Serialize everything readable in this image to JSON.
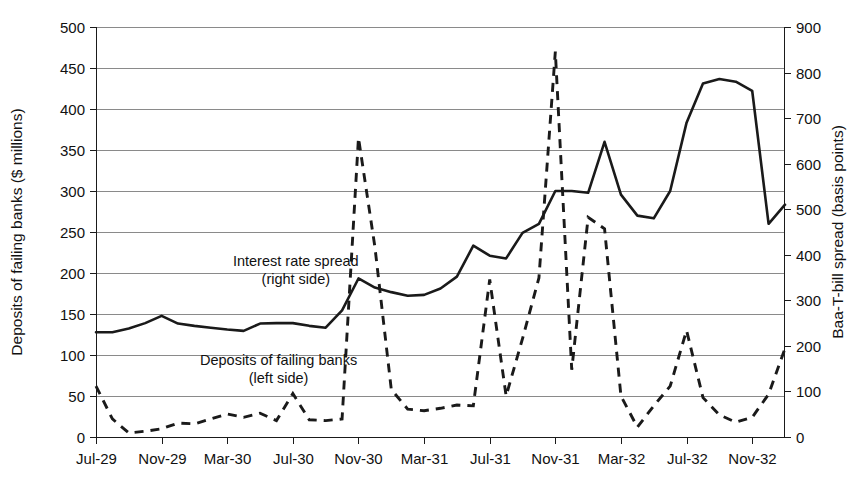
{
  "chart_data": {
    "type": "line",
    "title": "",
    "xlabel": "",
    "grid": true,
    "legend_position": "inline-annotations",
    "x_tick_labels": [
      "Jul-29",
      "Nov-29",
      "Mar-30",
      "Jul-30",
      "Nov-30",
      "Mar-31",
      "Jul-31",
      "Nov-31",
      "Mar-32",
      "Jul-32",
      "Nov-32"
    ],
    "x_tick_index": [
      0,
      4,
      8,
      12,
      16,
      20,
      24,
      28,
      32,
      36,
      40
    ],
    "x_points": 43,
    "left_axis": {
      "label": "Deposits of failing banks  ($ millions)",
      "ylim": [
        0,
        500
      ],
      "ticks": [
        0,
        50,
        100,
        150,
        200,
        250,
        300,
        350,
        400,
        450,
        500
      ]
    },
    "right_axis": {
      "label": "Baa-T-bill spread  (basis points)",
      "ylim": [
        0,
        900
      ],
      "ticks": [
        0,
        100,
        200,
        300,
        400,
        500,
        600,
        700,
        800,
        900
      ]
    },
    "annotations": [
      {
        "name": "interest-rate-spread-annotation",
        "line1": "Interest rate spread",
        "line2": "(right side)",
        "x": 0.29,
        "y_left": 208
      },
      {
        "name": "deposits-annotation",
        "line1": "Deposits of failing banks",
        "line2": "(left side)",
        "x": 0.265,
        "y_left": 88
      }
    ],
    "series": [
      {
        "name": "Deposits of failing banks",
        "style": "dashed",
        "axis": "left",
        "unit": "$ millions",
        "values": [
          62,
          22,
          5,
          7,
          10,
          17,
          16,
          22,
          28,
          24,
          29,
          20,
          53,
          21,
          20,
          22,
          365,
          232,
          58,
          34,
          32,
          35,
          39,
          38,
          192,
          50,
          120,
          194,
          470,
          82,
          268,
          254,
          50,
          12,
          38,
          62,
          130,
          48,
          27,
          18,
          24,
          52,
          108
        ]
      },
      {
        "name": "Interest rate spread",
        "style": "solid",
        "axis": "right",
        "unit": "basis points",
        "values": [
          230,
          230,
          238,
          250,
          266,
          249,
          244,
          240,
          236,
          233,
          249,
          250,
          250,
          244,
          240,
          278,
          348,
          328,
          318,
          310,
          312,
          326,
          352,
          420,
          398,
          392,
          448,
          468,
          540,
          540,
          536,
          648,
          532,
          486,
          480,
          540,
          690,
          776,
          786,
          780,
          760,
          468,
          510
        ]
      }
    ]
  }
}
